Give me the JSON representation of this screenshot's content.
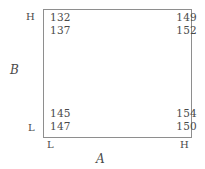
{
  "chart_data": {
    "type": "table",
    "title": "",
    "subtitle": "",
    "xlabel": "A",
    "ylabel": "B",
    "grid": false,
    "legend": false,
    "factors": [
      {
        "name": "A",
        "axis": "x",
        "levels": [
          "L",
          "H"
        ]
      },
      {
        "name": "B",
        "axis": "y",
        "levels": [
          "L",
          "H"
        ]
      }
    ],
    "x_tick_labels": [
      "L",
      "H"
    ],
    "y_tick_labels": [
      "L",
      "H"
    ],
    "corners": [
      {
        "id": "low-A-high-B",
        "A": "L",
        "B": "H",
        "position": "top-left",
        "values": [
          132,
          137
        ]
      },
      {
        "id": "high-A-high-B",
        "A": "H",
        "B": "H",
        "position": "top-right",
        "values": [
          149,
          152
        ]
      },
      {
        "id": "low-A-low-B",
        "A": "L",
        "B": "L",
        "position": "bottom-left",
        "values": [
          145,
          147
        ]
      },
      {
        "id": "high-A-low-B",
        "A": "H",
        "B": "L",
        "position": "bottom-right",
        "values": [
          154,
          150
        ]
      }
    ]
  },
  "plot": {
    "axis_titles": {
      "horizontal": "A",
      "vertical": "B"
    },
    "ticks": {
      "b_high": "H",
      "b_low": "L",
      "a_low": "L",
      "a_high": "H"
    },
    "corners": {
      "top_left": {
        "obs1": "132",
        "obs2": "137"
      },
      "top_right": {
        "obs1": "149",
        "obs2": "152"
      },
      "bottom_left": {
        "obs1": "145",
        "obs2": "147"
      },
      "bottom_right": {
        "obs1": "154",
        "obs2": "150"
      }
    }
  },
  "colors": {
    "background": "#ffffff",
    "text": "#4a4a4a",
    "box_border": "#8e8e8e"
  }
}
